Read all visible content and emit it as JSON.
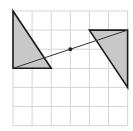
{
  "diagram": {
    "type": "geometry-grid",
    "grid": {
      "columns": 6,
      "rows": 6,
      "origin_px": [
        13,
        11
      ],
      "cell_px": 19.1,
      "line_color": "#d4d4d4"
    },
    "shapes": [
      {
        "name": "left-triangle",
        "vertices_grid": [
          [
            0,
            0
          ],
          [
            0,
            3
          ],
          [
            2,
            3
          ]
        ],
        "fill": "#c8c8c8",
        "stroke": "#1a1a1a"
      },
      {
        "name": "right-triangle",
        "vertices_grid": [
          [
            4,
            1
          ],
          [
            6,
            1
          ],
          [
            6,
            4
          ]
        ],
        "fill": "#c8c8c8",
        "stroke": "#1a1a1a"
      }
    ],
    "segment": {
      "from_grid": [
        0,
        3
      ],
      "to_grid": [
        6,
        1
      ],
      "stroke": "#333333"
    },
    "center_point": {
      "grid": [
        3,
        2
      ],
      "color": "#222222"
    }
  }
}
